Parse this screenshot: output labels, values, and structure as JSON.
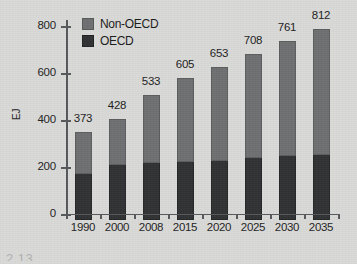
{
  "chart_data": {
    "type": "bar",
    "subtype": "stacked-bar",
    "title": "",
    "xlabel": "",
    "ylabel": "EJ",
    "ylim": [
      0,
      880
    ],
    "yticks": [
      0,
      200,
      400,
      600,
      800
    ],
    "ytick_labels": [
      "0",
      "200",
      "400",
      "600",
      "800"
    ],
    "grid": false,
    "legend_position": "top-left",
    "categories": [
      "1990",
      "2000",
      "2008",
      "2015",
      "2020",
      "2025",
      "2030",
      "2035"
    ],
    "series": [
      {
        "name": "OECD",
        "color": "#2f3133",
        "values": [
          196,
          234,
          243,
          247,
          253,
          263,
          273,
          278
        ]
      },
      {
        "name": "Non-OECD",
        "color": "#6d6f71",
        "values": [
          177,
          194,
          290,
          358,
          400,
          445,
          488,
          534
        ]
      }
    ],
    "totals": [
      373,
      428,
      533,
      605,
      653,
      708,
      761,
      812
    ],
    "total_labels": [
      "373",
      "428",
      "533",
      "605",
      "653",
      "708",
      "761",
      "812"
    ],
    "annotations": []
  },
  "legend": {
    "items": [
      {
        "label": "Non-OECD",
        "color": "#6d6f71",
        "swatch": "square-swatch-gray"
      },
      {
        "label": "OECD",
        "color": "#2f3133",
        "swatch": "square-swatch-black"
      }
    ]
  },
  "axes": {
    "y_title": "EJ",
    "y_tick_labels": [
      "800",
      "600",
      "400",
      "200",
      "0"
    ],
    "x_tick_labels": [
      "1990",
      "2000",
      "2008",
      "2015",
      "2020",
      "2025",
      "2030",
      "2035"
    ]
  },
  "page": {
    "background_color": "#d9d9d7",
    "caption_fragment": "2.13"
  }
}
